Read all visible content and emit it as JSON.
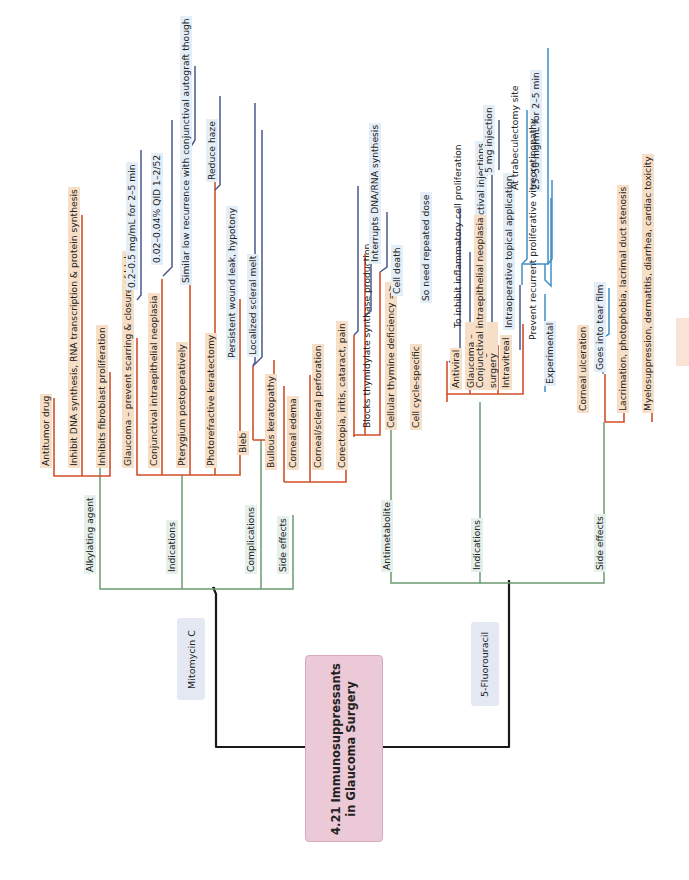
{
  "title": {
    "line1": "4.21 Immunosuppressants",
    "line2": "in Glaucoma Surgery"
  },
  "colors": {
    "root_line": "#1a1a1a",
    "level1": "#6a9a72",
    "level2": "#d24f2a",
    "level3_mmc": "#4b5a8c",
    "level3_5fu": "#3f8fc5",
    "tan_bg": "#f6dfc6",
    "title_bg": "#ecc9d6",
    "drug_bg": "#e3e8f2"
  },
  "mitomycin": {
    "label": "Mitomycin C",
    "alkylating": {
      "label": "Alkylating agent",
      "items": [
        "Antitumor drug",
        "Inhibit DNA synthesis, RNA transcription & protein synthesis",
        "Inhibits fibroblast proliferation"
      ]
    },
    "indications": {
      "label": "Indications",
      "items": [
        {
          "label": "Glaucoma – prevent scarring & closure of bleb",
          "detail": "0.2–0.5 mg/mL for 2–5 min"
        },
        {
          "label": "Conjunctival intraepithelial neoplasia",
          "detail": "0.02–0.04% QID 1–2/52"
        },
        {
          "label": "Pterygium postoperatively",
          "detail": "Similar low recurrence with conjunctival autograft though"
        },
        {
          "label": "Photorefractive keratectomy",
          "detail": "Reduce haze"
        }
      ]
    },
    "complications": {
      "label": "Complications",
      "items": [
        {
          "label": "Bleb",
          "details": [
            "Persistent wound leak, hypotony",
            "Localized scleral melt"
          ]
        },
        {
          "label": "Bullous keratopathy"
        }
      ]
    },
    "side_effects": {
      "label": "Side effects",
      "items": [
        "Corneal edema",
        "Corneal/scleral perforation",
        "Corectopia, iritis, cataract, pain"
      ]
    }
  },
  "fluorouracil": {
    "label": "5-Fluorouracil",
    "antimetabolite": {
      "label": "Antimetabolite",
      "items": [
        {
          "label": "Blocks thymidylate synthase production",
          "detail": "Interrupts DNA/RNA synthesis"
        },
        {
          "label": "Cellular thymine deficiency =>",
          "detail": "Cell death"
        },
        {
          "label": "Cell cycle-specific",
          "detail": "So need repeated dose"
        }
      ]
    },
    "indications": {
      "label": "Indications",
      "glaucoma": {
        "label": "Glaucoma – filtering surgery",
        "details": [
          {
            "label": "To inhibit inflammatory cell proliferation"
          },
          {
            "label": "Postoperative subconjunctival injections",
            "detail": "5 mg injection"
          },
          {
            "label": "Intraoperative topical application",
            "details": [
              "At trabeculectomy site",
              "25–50 mg/mL for 2–5 min"
            ]
          }
        ]
      },
      "items": [
        "Antiviral",
        "Conjunctival intraepithelial neoplasia",
        "Intravitreal"
      ],
      "intravitreal_details": [
        "Prevent recurrent proliferative vitreoretinopathy",
        "Experimental"
      ]
    },
    "side_effects": {
      "label": "Side effects",
      "items": [
        {
          "label": "Corneal ulceration",
          "detail": "Goes into tear film"
        },
        {
          "label": "Lacrimation, photophobia, lacrimal duct stenosis"
        },
        {
          "label": "Myelosuppression, dermatitis, diarrhea, cardiac toxicity"
        }
      ]
    }
  }
}
